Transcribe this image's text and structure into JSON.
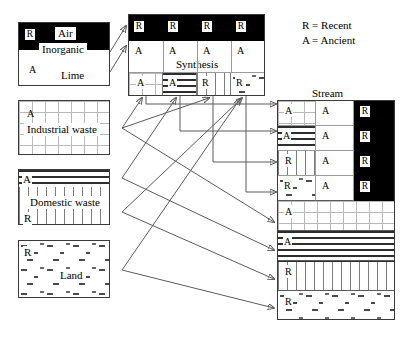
{
  "legend": {
    "text": "R = Recent\nA = Ancient",
    "recent_key": "R",
    "recent_label": "Recent",
    "ancient_key": "A",
    "ancient_label": "Ancient"
  },
  "sources": {
    "air_box": {
      "title_air": "Air",
      "title_inorganic": "Inorganic",
      "title_lime": "Lime",
      "tag_top": "R",
      "tag_bottom": "A"
    },
    "industrial": {
      "label": "Industrial waste",
      "tag": "A",
      "pattern": "grid"
    },
    "domestic": {
      "label": "Domestic waste",
      "tag_top": "A",
      "tag_bottom": "R",
      "pattern_top": "horizontal-lines",
      "pattern_bottom": "vertical-lines"
    },
    "land": {
      "label": "Land",
      "tag": "R",
      "pattern": "dots"
    }
  },
  "synthesis": {
    "title": "Synthesis",
    "row_black": {
      "tags": [
        "R",
        "R",
        "R",
        "R"
      ]
    },
    "row_white": {
      "tags": [
        "A",
        "A",
        "A",
        "A"
      ]
    },
    "row_pattern": {
      "tags": [
        "A",
        "A",
        "R",
        "R"
      ],
      "patterns": [
        "grid",
        "horizontal-lines",
        "vertical-lines",
        "dots"
      ]
    }
  },
  "stream": {
    "title": "Stream",
    "upper_rows": [
      {
        "col1_tag": "A",
        "col1_pattern": "grid",
        "col2_tag": "A",
        "col3_tag": "R"
      },
      {
        "col1_tag": "A",
        "col1_pattern": "horizontal-lines",
        "col2_tag": "A",
        "col3_tag": "R"
      },
      {
        "col1_tag": "R",
        "col1_pattern": "vertical-lines",
        "col2_tag": "A",
        "col3_tag": "R"
      },
      {
        "col1_tag": "R",
        "col1_pattern": "dots",
        "col2_tag": "A",
        "col3_tag": "R"
      }
    ],
    "lower_rows": [
      {
        "tag": "A",
        "pattern": "grid"
      },
      {
        "tag": "A",
        "pattern": "horizontal-lines"
      },
      {
        "tag": "R",
        "pattern": "vertical-lines"
      },
      {
        "tag": "R",
        "pattern": "dots"
      }
    ]
  },
  "colors": {
    "ink": "#000000",
    "line": "#5a5a5a",
    "border": "#3a3a3a",
    "grid": "#b9b9b9"
  }
}
